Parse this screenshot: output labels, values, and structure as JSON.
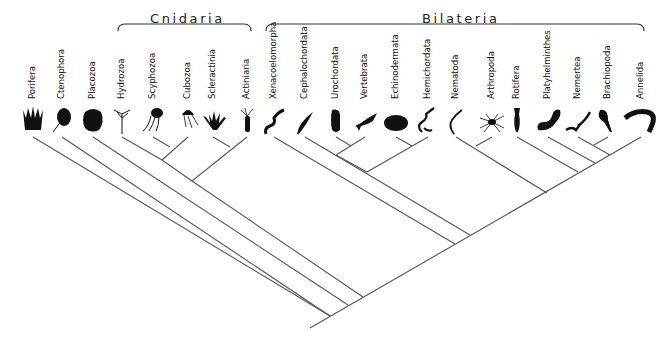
{
  "diagram": {
    "type": "phylogenetic-tree (cladogram)",
    "line_color": "#555555",
    "silhouette_color": "#111111",
    "clades": [
      {
        "name": "Cnidaria",
        "label_x": 150,
        "label_y": 11,
        "bracket": [
          118,
          251,
          24
        ]
      },
      {
        "name": "Bilateria",
        "label_x": 422,
        "label_y": 11,
        "bracket": [
          266,
          644,
          24
        ]
      }
    ],
    "taxa": [
      {
        "name": "Porifera",
        "x": 33,
        "icon": "sponge-silhouette"
      },
      {
        "name": "Ctenophora",
        "x": 62,
        "icon": "comb-jelly-silhouette"
      },
      {
        "name": "Placozoa",
        "x": 93,
        "icon": "placozoan-blob-silhouette"
      },
      {
        "name": "Hydrozoa",
        "x": 122,
        "icon": "hydroid-silhouette"
      },
      {
        "name": "Scyphozoa",
        "x": 153,
        "icon": "jellyfish-silhouette"
      },
      {
        "name": "Cubozoa",
        "x": 188,
        "icon": "box-jelly-silhouette"
      },
      {
        "name": "Scleractinia",
        "x": 213,
        "icon": "coral-silhouette"
      },
      {
        "name": "Actiniaria",
        "x": 247,
        "icon": "sea-anemone-silhouette"
      },
      {
        "name": "Xenacoelomorpha",
        "x": 274,
        "icon": "acoel-worm-silhouette"
      },
      {
        "name": "Cephalochordata",
        "x": 305,
        "icon": "lancelet-silhouette"
      },
      {
        "name": "Urochordata",
        "x": 336,
        "icon": "tunicate-silhouette"
      },
      {
        "name": "Vertebrata",
        "x": 365,
        "icon": "fish-silhouette"
      },
      {
        "name": "Echinodermata",
        "x": 396,
        "icon": "sea-urchin-silhouette"
      },
      {
        "name": "Hemichordata",
        "x": 428,
        "icon": "acorn-worm-silhouette"
      },
      {
        "name": "Nematoda",
        "x": 456,
        "icon": "roundworm-silhouette"
      },
      {
        "name": "Arthropoda",
        "x": 492,
        "icon": "spider-silhouette"
      },
      {
        "name": "Rotifera",
        "x": 517,
        "icon": "rotifer-silhouette"
      },
      {
        "name": "Platyhelminthes",
        "x": 548,
        "icon": "flatworm-silhouette"
      },
      {
        "name": "Nemertea",
        "x": 578,
        "icon": "ribbon-worm-silhouette"
      },
      {
        "name": "Brachiopoda",
        "x": 608,
        "icon": "lamp-shell-silhouette"
      },
      {
        "name": "Annelida",
        "x": 641,
        "icon": "segmented-worm-silhouette"
      }
    ],
    "tree": {
      "tip_y": 137,
      "root": [
        310,
        328
      ],
      "edges": [
        [
          [
            310,
            328
          ],
          [
            641,
            137
          ]
        ],
        [
          [
            33,
            137
          ],
          [
            330,
            316
          ]
        ],
        [
          [
            62,
            137
          ],
          [
            330,
            316
          ]
        ],
        [
          [
            93,
            137
          ],
          [
            348,
            305
          ]
        ],
        [
          [
            192,
            181
          ],
          [
            363,
            297
          ]
        ],
        [
          [
            122,
            137
          ],
          [
            162,
            160
          ]
        ],
        [
          [
            153,
            137
          ],
          [
            170,
            147
          ]
        ],
        [
          [
            188,
            137
          ],
          [
            162,
            160
          ]
        ],
        [
          [
            213,
            137
          ],
          [
            230,
            147
          ]
        ],
        [
          [
            247,
            137
          ],
          [
            192,
            181
          ]
        ],
        [
          [
            162,
            160
          ],
          [
            192,
            181
          ]
        ],
        [
          [
            274,
            137
          ],
          [
            455,
            244
          ]
        ],
        [
          [
            305,
            137
          ],
          [
            470,
            235
          ]
        ],
        [
          [
            336,
            137
          ],
          [
            351,
            146
          ]
        ],
        [
          [
            365,
            137
          ],
          [
            336,
            155
          ]
        ],
        [
          [
            396,
            137
          ],
          [
            412,
            146
          ]
        ],
        [
          [
            428,
            137
          ],
          [
            367,
            172
          ]
        ],
        [
          [
            336,
            155
          ],
          [
            367,
            172
          ]
        ],
        [
          [
            456,
            137
          ],
          [
            547,
            193
          ]
        ],
        [
          [
            492,
            137
          ],
          [
            476,
            146
          ]
        ],
        [
          [
            517,
            137
          ],
          [
            578,
            172
          ]
        ],
        [
          [
            548,
            137
          ],
          [
            595,
            163
          ]
        ],
        [
          [
            578,
            137
          ],
          [
            610,
            155
          ]
        ],
        [
          [
            608,
            137
          ],
          [
            594,
            145
          ]
        ]
      ]
    }
  }
}
